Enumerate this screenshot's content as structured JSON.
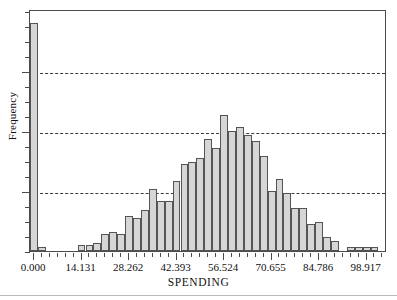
{
  "chart_data": {
    "type": "bar",
    "title": "",
    "xlabel": "SPENDING",
    "ylabel": "Frequency",
    "grid": true,
    "legend": null,
    "bin_width": 2.3552,
    "xlim": [
      -1.2,
      105.0
    ],
    "ylim": [
      0,
      125
    ],
    "x_tick_labels": [
      "0.000",
      "14.131",
      "28.262",
      "42.393",
      "56.524",
      "70.655",
      "84.786",
      "98.917"
    ],
    "x_tick_values": [
      0.0,
      14.131,
      28.262,
      42.393,
      56.524,
      70.655,
      84.786,
      98.917
    ],
    "y_gridline_values": [
      31,
      62,
      93
    ],
    "bin_centers": [
      0.0,
      2.36,
      4.71,
      7.07,
      9.42,
      11.78,
      14.13,
      16.49,
      18.84,
      21.2,
      23.55,
      25.91,
      28.26,
      30.62,
      32.97,
      35.33,
      37.68,
      40.04,
      42.39,
      44.75,
      47.1,
      49.46,
      51.81,
      54.17,
      56.52,
      58.88,
      61.24,
      63.59,
      65.95,
      68.3,
      70.66,
      73.01,
      75.37,
      77.72,
      80.08,
      82.43,
      84.79,
      87.14,
      89.5,
      91.85,
      94.21,
      96.56,
      98.92,
      101.27
    ],
    "values": [
      118,
      2,
      0,
      0,
      0,
      0,
      3,
      3,
      4,
      9,
      10,
      9,
      18,
      17,
      21,
      32,
      26,
      26,
      36,
      45,
      46,
      48,
      58,
      53,
      70,
      62,
      64,
      60,
      57,
      49,
      31,
      37,
      30,
      22,
      22,
      14,
      15,
      7,
      5,
      0,
      2,
      2,
      2,
      2
    ],
    "bar_color": "#d6d6d6",
    "bar_edge_color": "#555555",
    "grid_color": "#3a3a3a",
    "frame_color": "#4a4a4a"
  },
  "axes": {
    "x_title": "SPENDING",
    "y_title": "Frequency"
  }
}
